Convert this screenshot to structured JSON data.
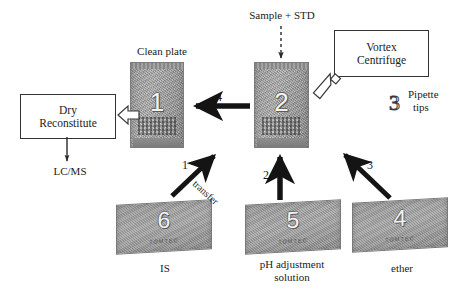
{
  "diagram": {
    "title_present": false,
    "labels": {
      "clean_plate": "Clean plate",
      "sample_std": "Sample + STD",
      "pipette_tips_line1": "Pipette",
      "pipette_tips_line2": "tips",
      "lcms": "LC/MS",
      "is": "IS",
      "ph_line1": "pH adjustment",
      "ph_line2": "solution",
      "ether": "ether",
      "transfer": "transfer"
    },
    "boxes": [
      {
        "id": "dry-reconstitute",
        "line1": "Dry",
        "line2": "Reconstitute"
      },
      {
        "id": "vortex-centrifuge",
        "line1": "Vortex",
        "line2": "Centrifuge"
      }
    ],
    "plates": [
      {
        "id": "plate-1",
        "number": "1",
        "kind": "microplate",
        "caption": "Clean plate"
      },
      {
        "id": "plate-2",
        "number": "2",
        "kind": "microplate",
        "caption": "Sample + STD"
      },
      {
        "id": "plate-4",
        "number": "4",
        "kind": "reservoir",
        "brand": "TOMTEC",
        "caption": "ether"
      },
      {
        "id": "plate-5",
        "number": "5",
        "kind": "reservoir",
        "brand": "TOMTEC",
        "caption": "pH adjustment solution"
      },
      {
        "id": "plate-6",
        "number": "6",
        "kind": "reservoir",
        "brand": "TOMTEC",
        "caption": "IS"
      }
    ],
    "pipette_tips_number": "3",
    "step_numbers": {
      "step1": "1",
      "step2": "2",
      "step3": "3",
      "step4": "4"
    },
    "colors": {
      "plate_gray": "#9d9d9d",
      "arrow_black": "#141414",
      "outline": "#333333",
      "text": "#1c1c1c",
      "background": "#ffffff"
    }
  }
}
